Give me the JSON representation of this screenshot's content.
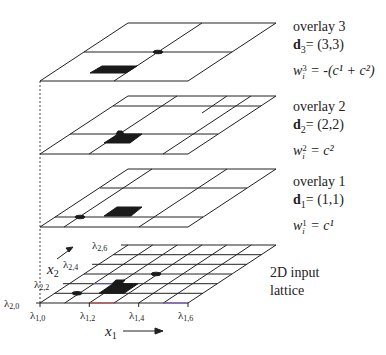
{
  "diagram": {
    "type": "layered lattice overlays",
    "overlays": [
      {
        "name": "overlay 3",
        "title": "overlay 3",
        "d_label": "d",
        "d_sub": "3",
        "d_value": "= (3,3)",
        "w_base": "w",
        "w_sub": "i",
        "w_sup": "3",
        "w_rhs": " = -(c¹ + c²)",
        "cells": [
          2,
          2
        ]
      },
      {
        "name": "overlay 2",
        "title": "overlay 2",
        "d_label": "d",
        "d_sub": "2",
        "d_value": "= (2,2)",
        "w_base": "w",
        "w_sub": "i",
        "w_sup": "2",
        "w_rhs": " = c²",
        "cells": [
          3,
          3
        ]
      },
      {
        "name": "overlay 1",
        "title": "overlay 1",
        "d_label": "d",
        "d_sub": "1",
        "d_value": "= (1,1)",
        "w_base": "w",
        "w_sub": "i",
        "w_sup": "1",
        "w_rhs": " = c¹",
        "cells": [
          3,
          3
        ]
      }
    ],
    "lattice": {
      "title_line1": "2D input",
      "title_line2": "lattice",
      "cells": [
        6,
        6
      ],
      "x1_ticks": [
        "λ1,0",
        "λ1,2",
        "λ1,4",
        "λ1,6"
      ],
      "x2_ticks": [
        "λ2,0",
        "λ2,2",
        "λ2,4",
        "λ2,6"
      ],
      "x1_axis_label": "x",
      "x1_axis_sub": "1",
      "x2_axis_label": "x",
      "x2_axis_sub": "2"
    },
    "colors": {
      "line": "#222222",
      "fill": "#1a1a1a",
      "dashed": "#444444"
    }
  }
}
